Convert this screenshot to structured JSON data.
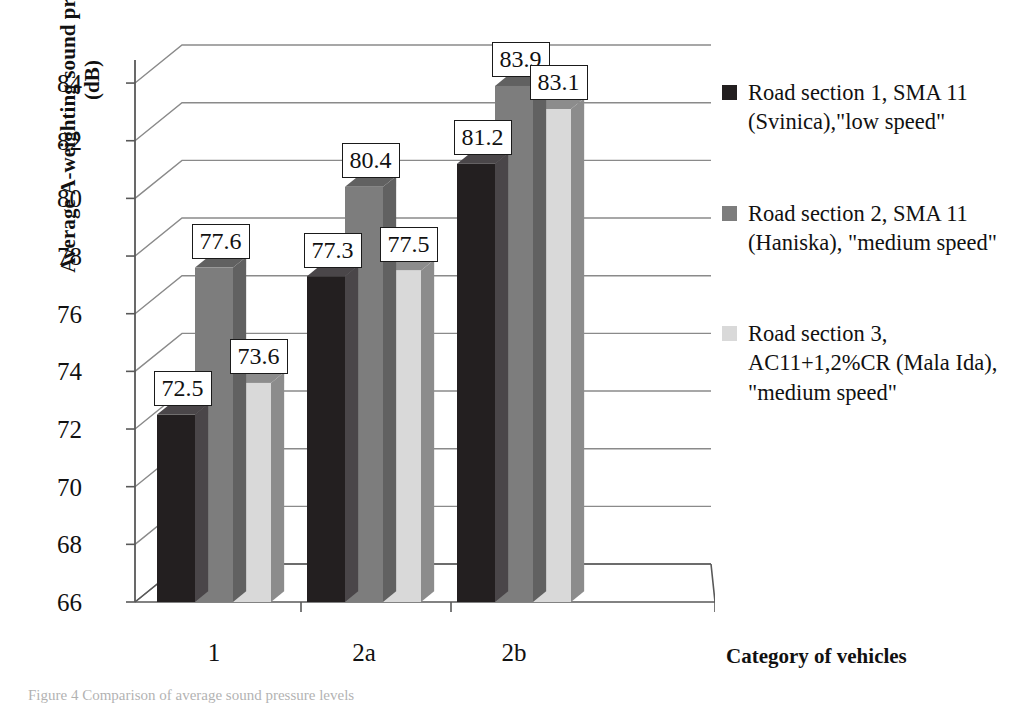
{
  "chart_data": {
    "type": "bar",
    "title": "",
    "xlabel": "Category of vehicles",
    "ylabel": "Average A-weighting sound pressure levels (dB)",
    "ylabel_line1": "Average A-weighting sound pressure levels",
    "ylabel_line2": "(dB)",
    "categories": [
      "1",
      "2a",
      "2b"
    ],
    "ylim": [
      66,
      84.8
    ],
    "yticks": [
      66,
      68,
      70,
      72,
      74,
      76,
      78,
      80,
      82,
      84
    ],
    "ytick_labels": [
      "66",
      "68",
      "70",
      "72",
      "74",
      "76",
      "78",
      "80",
      "82",
      "84"
    ],
    "grid": true,
    "legend_position": "right",
    "style": "3d-clustered-column",
    "series": [
      {
        "name": "Road section 1, SMA 11 (Svinica),\"low speed\"",
        "color": "#231f20",
        "side_color": "#4a4649",
        "values": [
          72.5,
          77.3,
          81.2
        ],
        "labels": [
          "72.5",
          "77.3",
          "81.2"
        ]
      },
      {
        "name": "Road section 2, SMA 11 (Haniska), \"medium speed\"",
        "color": "#7d7d7d",
        "side_color": "#616161",
        "values": [
          77.6,
          80.4,
          83.9
        ],
        "labels": [
          "77.6",
          "80.4",
          "83.9"
        ]
      },
      {
        "name": "Road section 3, AC11+1,2%CR (Mala Ida), \"medium speed\"",
        "color": "#d9d9d9",
        "side_color": "#8c8c8c",
        "values": [
          73.6,
          77.5,
          83.1
        ],
        "labels": [
          "73.6",
          "77.5",
          "83.1"
        ]
      }
    ]
  },
  "legend": {
    "items": [
      {
        "swatch_color": "#231f20",
        "label": "Road section 1, SMA 11 (Svinica),\"low speed\""
      },
      {
        "swatch_color": "#7d7d7d",
        "label": "Road section 2, SMA 11 (Haniska), \"medium speed\""
      },
      {
        "swatch_color": "#d9d9d9",
        "label": "Road section 3, AC11+1,2%CR (Mala Ida), \"medium speed\""
      }
    ]
  },
  "caption": {
    "text": "Figure 4    Comparison of average sound pressure levels"
  },
  "colors": {
    "axis": "#595959",
    "grid": "#8a8a8a",
    "text": "#111111",
    "label_border": "#1a1a1a",
    "label_bg": "#ffffff"
  }
}
